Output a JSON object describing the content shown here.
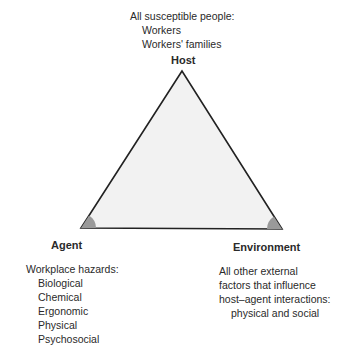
{
  "host": {
    "label": "Host",
    "description": "All susceptible people:",
    "items": [
      "Workers",
      "Workers' families"
    ]
  },
  "agent": {
    "label": "Agent",
    "description": "Workplace hazards:",
    "items": [
      "Biological",
      "Chemical",
      "Ergonomic",
      "Physical",
      "Psychosocial"
    ]
  },
  "environment": {
    "label": "Environment",
    "description_lines": [
      "All other external",
      "factors that influence",
      "host–agent interactions:"
    ],
    "detail": "physical and social"
  },
  "colors": {
    "triangle_fill": "#f2f2f2",
    "triangle_stroke": "#222222",
    "angle_marker": "#9a9a9a"
  }
}
